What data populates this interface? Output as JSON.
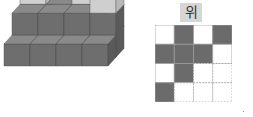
{
  "figure": {
    "view_label": "위",
    "colors": {
      "dark_top": "#8a8a8a",
      "dark_left": "#6e6e6e",
      "dark_right": "#5a5a5a",
      "light_top": "#ececec",
      "light_left": "#cfcfcf",
      "light_right": "#b8b8b8",
      "grid_dark": "#6b6b6b",
      "grid_line": "#9a9a9a"
    },
    "cubes": [
      {
        "x": 2,
        "y": 2,
        "z": 0,
        "shade": "dark"
      },
      {
        "x": 2,
        "y": 2,
        "z": 1,
        "shade": "dark"
      },
      {
        "x": 2,
        "y": 2,
        "z": 2,
        "shade": "light"
      },
      {
        "x": 1,
        "y": 2,
        "z": 0,
        "shade": "dark"
      },
      {
        "x": 1,
        "y": 2,
        "z": 1,
        "shade": "dark"
      },
      {
        "x": 0,
        "y": 2,
        "z": 0,
        "shade": "dark"
      },
      {
        "x": 0,
        "y": 2,
        "z": 1,
        "shade": "dark"
      },
      {
        "x": 0,
        "y": 2,
        "z": 2,
        "shade": "light"
      },
      {
        "x": 3,
        "y": 1,
        "z": 0,
        "shade": "dark"
      },
      {
        "x": 3,
        "y": 1,
        "z": 1,
        "shade": "dark"
      },
      {
        "x": 3,
        "y": 1,
        "z": 2,
        "shade": "light"
      },
      {
        "x": 2,
        "y": 1,
        "z": 0,
        "shade": "dark"
      },
      {
        "x": 2,
        "y": 1,
        "z": 1,
        "shade": "dark"
      },
      {
        "x": 1,
        "y": 1,
        "z": 0,
        "shade": "dark"
      },
      {
        "x": 1,
        "y": 1,
        "z": 1,
        "shade": "dark"
      },
      {
        "x": 0,
        "y": 1,
        "z": 0,
        "shade": "dark"
      },
      {
        "x": 0,
        "y": 1,
        "z": 1,
        "shade": "dark"
      },
      {
        "x": 3,
        "y": 0,
        "z": 0,
        "shade": "dark"
      },
      {
        "x": 2,
        "y": 0,
        "z": 0,
        "shade": "dark"
      },
      {
        "x": 1,
        "y": 0,
        "z": 0,
        "shade": "dark"
      },
      {
        "x": 0,
        "y": 0,
        "z": 0,
        "shade": "dark"
      }
    ],
    "top_view_grid": [
      [
        "white",
        "dark",
        "white",
        "dark"
      ],
      [
        "dark",
        "dark",
        "dark",
        "white"
      ],
      [
        "white",
        "dark",
        "white-dashed",
        "white-dashed"
      ],
      [
        "dark",
        "white-dashed",
        "white-dashed",
        "white-dashed"
      ]
    ]
  }
}
